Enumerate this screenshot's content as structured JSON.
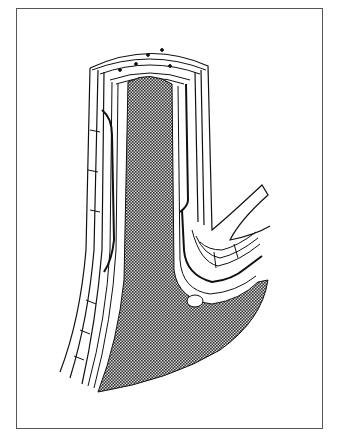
{
  "figure": {
    "type": "anatomical-line-drawing",
    "labels": [],
    "colors": {
      "frame": "#555555",
      "line": "#111111",
      "lumen_fill": "#6e6e6e",
      "background": "#ffffff"
    }
  }
}
